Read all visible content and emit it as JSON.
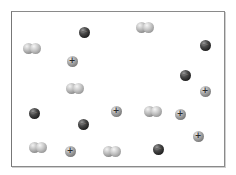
{
  "diagram": {
    "frame": {
      "x": 11,
      "y": 11,
      "width": 214,
      "height": 156,
      "border_color": "#8a8a8a"
    },
    "legend_colors": {
      "diatomic": "#bdbdbd",
      "anion": "#1e1e1e",
      "cation": "#a8a8a8"
    },
    "particles": [
      {
        "type": "diatomic",
        "x": 32,
        "y": 48,
        "sign": ""
      },
      {
        "type": "diatomic",
        "x": 145,
        "y": 27,
        "sign": ""
      },
      {
        "type": "diatomic",
        "x": 75,
        "y": 88,
        "sign": ""
      },
      {
        "type": "diatomic",
        "x": 153,
        "y": 111,
        "sign": ""
      },
      {
        "type": "diatomic",
        "x": 38,
        "y": 147,
        "sign": ""
      },
      {
        "type": "diatomic",
        "x": 112,
        "y": 151,
        "sign": ""
      },
      {
        "type": "anion",
        "x": 84,
        "y": 32,
        "sign": "−"
      },
      {
        "type": "anion",
        "x": 205,
        "y": 45,
        "sign": "−"
      },
      {
        "type": "anion",
        "x": 185,
        "y": 75,
        "sign": "−"
      },
      {
        "type": "anion",
        "x": 34,
        "y": 113,
        "sign": "−"
      },
      {
        "type": "anion",
        "x": 83,
        "y": 124,
        "sign": "−"
      },
      {
        "type": "anion",
        "x": 158,
        "y": 149,
        "sign": "−"
      },
      {
        "type": "cation",
        "x": 72,
        "y": 61,
        "sign": "+"
      },
      {
        "type": "cation",
        "x": 205,
        "y": 91,
        "sign": "+"
      },
      {
        "type": "cation",
        "x": 116,
        "y": 111,
        "sign": "+"
      },
      {
        "type": "cation",
        "x": 180,
        "y": 114,
        "sign": "+"
      },
      {
        "type": "cation",
        "x": 198,
        "y": 136,
        "sign": "+"
      },
      {
        "type": "cation",
        "x": 70,
        "y": 151,
        "sign": "+"
      }
    ]
  }
}
